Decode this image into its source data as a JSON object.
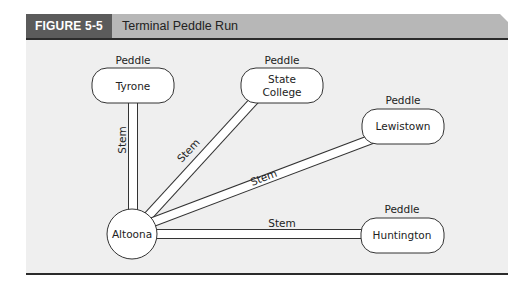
{
  "figure": {
    "label": "FIGURE 5-5",
    "title": "Terminal Peddle Run",
    "colors": {
      "label_bg": "#5b5b5b",
      "title_bar_bg": "#b7b7b7",
      "panel_bg": "#efefef",
      "rule": "#2b2b2b"
    }
  },
  "diagram": {
    "hub": {
      "name": "Altoona",
      "shape": "circle"
    },
    "nodes": [
      {
        "name": "Tyrone",
        "type_label": "Peddle"
      },
      {
        "name_line1": "State",
        "name_line2": "College",
        "type_label": "Peddle"
      },
      {
        "name": "Lewistown",
        "type_label": "Peddle"
      },
      {
        "name": "Huntington",
        "type_label": "Peddle"
      }
    ],
    "edges": [
      {
        "from": "Altoona",
        "to": "Tyrone",
        "label": "Stem"
      },
      {
        "from": "Altoona",
        "to": "State College",
        "label": "Stem"
      },
      {
        "from": "Altoona",
        "to": "Lewistown",
        "label": "Stem"
      },
      {
        "from": "Altoona",
        "to": "Huntington",
        "label": "Stem"
      }
    ]
  }
}
